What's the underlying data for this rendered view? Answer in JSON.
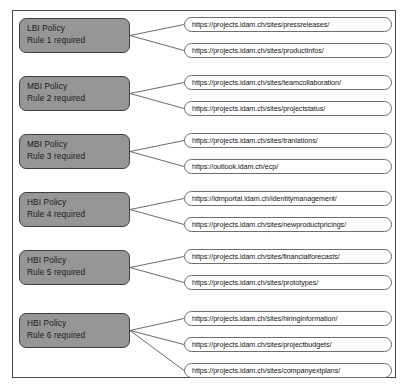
{
  "diagram": {
    "type": "policy-url-mapping",
    "frame": {
      "visible": true
    },
    "groups": [
      {
        "policy": {
          "classification": "LBI Policy",
          "rule": "Rule 1 required"
        },
        "urls": [
          "https://projects.idam.ch/sites/pressreleases/",
          "https://projects.idam.ch/sites/productinfos/"
        ]
      },
      {
        "policy": {
          "classification": "MBI Policy",
          "rule": "Rule 2 required"
        },
        "urls": [
          "https://projects.idam.ch/sites/teamcollaboration/",
          "https://projects.idam.ch/sites/projectstatus/"
        ]
      },
      {
        "policy": {
          "classification": "MBI Policy",
          "rule": "Rule 3 required"
        },
        "urls": [
          "https://projects.idam.ch/sites/tranlations/",
          "https://outlook.idam.ch/ecp/"
        ]
      },
      {
        "policy": {
          "classification": "HBI Policy",
          "rule": "Rule 4 required"
        },
        "urls": [
          "https://idmportal.idam.ch/identitymanagement/",
          "https://projects.idam.ch/sites/newproductpricings/"
        ]
      },
      {
        "policy": {
          "classification": "HBI Policy",
          "rule": "Rule 5 required"
        },
        "urls": [
          "https://projects.idam.ch/sites/financialforecasts/",
          "https://projects.idam.ch/sites/prototypes/"
        ]
      },
      {
        "policy": {
          "classification": "HBI Policy",
          "rule": "Rule 6 required"
        },
        "urls": [
          "https://projects.idam.ch/sites/hiringinformation/",
          "https://projects.idam.ch/sites/projectbudgets/",
          "https://projects.idam.ch/sites/companyextplans/"
        ]
      }
    ],
    "colors": {
      "policy_fill": "#969696",
      "policy_border": "#3f3f3f",
      "pill_fill": "#ffffff",
      "pill_border": "#6e6e6e",
      "connector": "#5a5a5a",
      "frame_border": "#4a4a4a"
    }
  }
}
